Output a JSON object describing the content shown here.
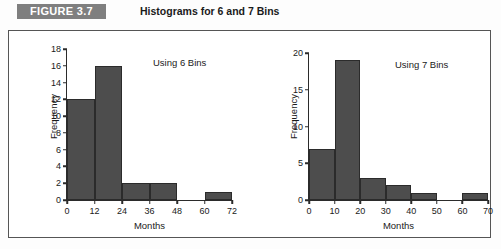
{
  "figure": {
    "badge_label": "FIGURE 3.7",
    "title": "Histograms for 6 and 7 Bins"
  },
  "colors": {
    "badge_background": "#7f7f7f",
    "badge_text": "#ffffff",
    "bar_fill": "#4d4d4d",
    "bar_border": "#2b2b2b",
    "axis": "#2b2b2b",
    "panel_border": "#555555",
    "plot_background": "#ffffff"
  },
  "chart_data": [
    {
      "id": "histogram-6-bins",
      "type": "bar",
      "title": "",
      "annotation": "Using 6 Bins",
      "xlabel": "Months",
      "ylabel": "Frequency",
      "categories": [
        "0-12",
        "12-24",
        "24-36",
        "36-48",
        "48-60",
        "60-72"
      ],
      "bin_edges": [
        0,
        12,
        24,
        36,
        48,
        60,
        72
      ],
      "values": [
        12,
        16,
        2,
        2,
        0,
        1
      ],
      "xlim": [
        0,
        72
      ],
      "ylim": [
        0,
        18
      ],
      "xticks": [
        0,
        12,
        24,
        36,
        48,
        60,
        72
      ],
      "yticks": [
        0,
        2,
        4,
        6,
        8,
        10,
        12,
        14,
        16,
        18
      ],
      "grid": false,
      "legend": false
    },
    {
      "id": "histogram-7-bins",
      "type": "bar",
      "title": "",
      "annotation": "Using 7 Bins",
      "xlabel": "Months",
      "ylabel": "Frequency",
      "categories": [
        "0-10",
        "10-20",
        "20-30",
        "30-40",
        "40-50",
        "50-60",
        "60-70"
      ],
      "bin_edges": [
        0,
        10,
        20,
        30,
        40,
        50,
        60,
        70
      ],
      "values": [
        7,
        19,
        3,
        2,
        1,
        0,
        1
      ],
      "xlim": [
        0,
        70
      ],
      "ylim": [
        0,
        20
      ],
      "xticks": [
        0,
        10,
        20,
        30,
        40,
        50,
        60,
        70
      ],
      "yticks": [
        0,
        5,
        10,
        15,
        20
      ],
      "grid": false,
      "legend": false
    }
  ]
}
